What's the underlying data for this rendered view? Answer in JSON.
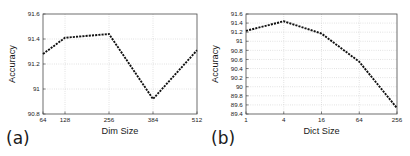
{
  "figure": {
    "background_color": "#ffffff",
    "line_color": "#111111",
    "grid_color": "#b8b8b8",
    "axis_color": "#4a4a4a"
  },
  "panels": [
    {
      "key": "a",
      "label": "(a)",
      "chart_data": {
        "type": "line",
        "title": "",
        "subtitle": "",
        "xlabel": "Dim Size",
        "ylabel": "Accuracy",
        "categories": [
          "64",
          "128",
          "256",
          "384",
          "512"
        ],
        "x": [
          64,
          128,
          256,
          384,
          512
        ],
        "values": [
          91.28,
          91.41,
          91.44,
          90.92,
          91.31
        ],
        "xtick_labels": [
          "64",
          "128",
          "256",
          "384",
          "512"
        ],
        "ytick_labels": [
          "90.8",
          "91",
          "91.2",
          "91.4",
          "91.6"
        ],
        "ytick_values": [
          90.8,
          91.0,
          91.2,
          91.4,
          91.6
        ],
        "xlim": [
          64,
          512
        ],
        "ylim": [
          90.8,
          91.6
        ],
        "grid": true,
        "legend": "none",
        "line_style": "dashed",
        "xscale": "linear"
      }
    },
    {
      "key": "b",
      "label": "(b)",
      "chart_data": {
        "type": "line",
        "title": "",
        "subtitle": "",
        "xlabel": "Dict Size",
        "ylabel": "Accuracy",
        "categories": [
          "1",
          "4",
          "16",
          "64",
          "256"
        ],
        "x": [
          1,
          4,
          16,
          64,
          256
        ],
        "values": [
          91.23,
          91.44,
          91.17,
          90.55,
          89.53
        ],
        "xtick_labels": [
          "1",
          "4",
          "16",
          "64",
          "256"
        ],
        "ytick_labels": [
          "89.4",
          "89.6",
          "89.8",
          "90",
          "90.2",
          "90.4",
          "90.6",
          "90.8",
          "91",
          "91.2",
          "91.4",
          "91.6"
        ],
        "ytick_values": [
          89.4,
          89.6,
          89.8,
          90.0,
          90.2,
          90.4,
          90.6,
          90.8,
          91.0,
          91.2,
          91.4,
          91.6
        ],
        "xlim": [
          1,
          256
        ],
        "ylim": [
          89.4,
          91.6
        ],
        "grid": true,
        "legend": "none",
        "line_style": "dashed",
        "xscale": "log4"
      }
    }
  ]
}
